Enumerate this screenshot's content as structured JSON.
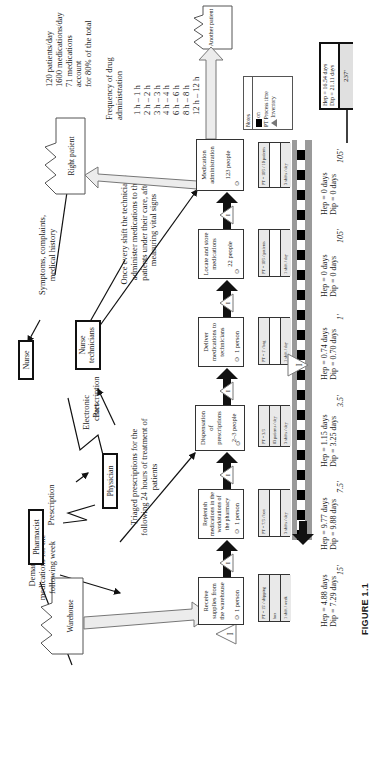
{
  "figure_label": "FIGURE 1.1",
  "entities": {
    "warehouse": "Warehouse",
    "right_patient": "Right patient",
    "another_patient": "Another patient",
    "pharmacist": "Pharmacist",
    "physician": "Physician",
    "nurse": "Nurse",
    "nurse_technicians": "Nurse technicians"
  },
  "annotations": {
    "demand": "Demand of\nmedications for the\nfollowing week",
    "prescription_1": "Prescription",
    "prescription_2": "Prescription",
    "electronic_chart": "Electronic\nchart",
    "symptoms": "Symptoms, complaints,\nmedical history",
    "triaged": "Triaged prescriptions for the\nfollowing 24 hours of treatment of\npatients",
    "once_every_shift": "Once every shift the technicians\nadminister medications to the\npatients under their care, after\nmeasuring vital signs",
    "patient_stats": "120 patients/day\n1600 medications/day\n71 medications\naccount\nfor 80% of the total",
    "frequency_title": "Frequency of drug\nadministration",
    "frequency_list": "1 h – 1 h\n2 h – 2 h\n3 h – 3 h\n4 h – 4 h\n6 h – 6 h\n8 h – 8 h\n12 h – 12 h"
  },
  "legend": {
    "title": "Notes",
    "on_label": "on",
    "pt_label": "PT Process time",
    "inventory_label": "Inventory"
  },
  "processes": [
    {
      "name": "Receive supplies from the warehouse",
      "people": "1 person",
      "data": [
        "PT = 15' / shipping",
        "box",
        "1 shift / week"
      ],
      "inventory": "I"
    },
    {
      "name": "Replenish medications in the workstations of the pharmacy",
      "people": "1 person",
      "data": [
        "PT = 7.5' / box",
        "",
        "3 shifts / day"
      ],
      "inventory": "I"
    },
    {
      "name": "Dispensation of prescriptions",
      "people": "2–3 people",
      "data": [
        "PT = 3.5'",
        "83 patients / day",
        "3 shifts / day"
      ],
      "inventory": "I"
    },
    {
      "name": "Deliver medications to technicians",
      "people": "1 person",
      "data": [
        "PT = 1' / bag",
        "",
        "1 shift / day"
      ],
      "inventory": "I"
    },
    {
      "name": "Locate and store medications",
      "people": "22 people",
      "data": [
        "PT = 105' / patients",
        "",
        "1 shift / day"
      ],
      "inventory": "I"
    },
    {
      "name": "Medication administration",
      "people": "123 people",
      "data": [
        "PT = 105' / 10 patients",
        "",
        "3 shifts / day"
      ]
    }
  ],
  "timeline": {
    "lead_times": [
      "Hep = 4.88 days\nDip = 7.29 days",
      "Hep = 9.77 days\nDip = 9.88 days",
      "Hep = 1.15 days\nDip = 3.25 days",
      "Hep = 0.74 days\nDip = 0.70 days",
      "Hep = 0 days\nDip = 0 days",
      "Hep = 0 days\nDip = 0 days"
    ],
    "process_times": [
      "15'",
      "7.5'",
      "3.5'",
      "1'",
      "105'",
      "105'"
    ],
    "totals": {
      "lead": "Hep = 16.54 days\nDip = 21.11 days",
      "process": "237'"
    },
    "inventory_marker": "I"
  },
  "colors": {
    "timeline_gray": "#9a9a9a",
    "data_row": "#e9e9e9",
    "push_arrow": "#111111",
    "flow_arrow_fill": "#ececec"
  }
}
